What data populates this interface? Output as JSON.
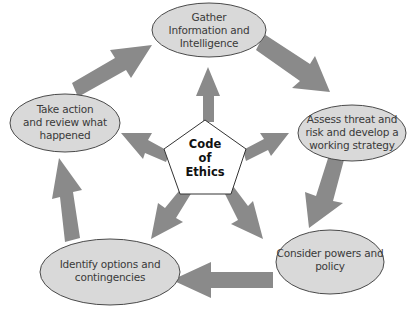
{
  "diagram": {
    "type": "cycle-with-hub",
    "colors": {
      "arrow": "#8a8a8a",
      "node_fill": "#d9d9d9",
      "node_stroke": "#4a4a4a",
      "hub_fill": "#ffffff",
      "hub_stroke": "#333333",
      "text": "#3a3a3a"
    },
    "hub": {
      "shape": "pentagon",
      "lines": [
        "Code",
        "of",
        "Ethics"
      ]
    },
    "nodes": [
      {
        "id": "gather",
        "lines": [
          "Gather",
          "Information and",
          "Intelligence"
        ]
      },
      {
        "id": "assess",
        "lines": [
          "Assess threat and",
          "risk and develop a",
          "working strategy"
        ]
      },
      {
        "id": "consider",
        "lines": [
          "Consider powers and",
          "policy"
        ]
      },
      {
        "id": "identify",
        "lines": [
          "Identify options and",
          "contingencies"
        ]
      },
      {
        "id": "take-action",
        "lines": [
          "Take action",
          "and review what",
          "happened"
        ]
      }
    ],
    "cycle_arrows": [
      {
        "from": "gather",
        "to": "assess"
      },
      {
        "from": "assess",
        "to": "consider"
      },
      {
        "from": "consider",
        "to": "identify"
      },
      {
        "from": "identify",
        "to": "take-action"
      },
      {
        "from": "take-action",
        "to": "gather"
      }
    ],
    "hub_arrows": [
      {
        "from": "hub",
        "to": "gather"
      },
      {
        "from": "hub",
        "to": "assess"
      },
      {
        "from": "hub",
        "to": "consider"
      },
      {
        "from": "hub",
        "to": "identify"
      },
      {
        "from": "hub",
        "to": "take-action"
      }
    ]
  }
}
